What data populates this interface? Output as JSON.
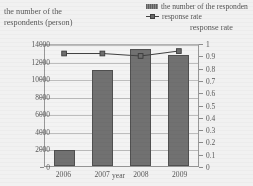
{
  "chart_data": {
    "type": "bar",
    "title": "",
    "categories": [
      "2006",
      "2007",
      "2008",
      "2009"
    ],
    "xlabel": "year",
    "ylabel": "the number of the respondents (person)",
    "y2label": "response rate",
    "ylim": [
      0,
      14000
    ],
    "y2lim": [
      0,
      1
    ],
    "yticks": [
      "0",
      "2000",
      "4000",
      "6000",
      "8000",
      "10000",
      "12000",
      "14000"
    ],
    "ytick_values": [
      0,
      2000,
      4000,
      6000,
      8000,
      10000,
      12000,
      14000
    ],
    "y2ticks": [
      "0",
      "0.1",
      "0.2",
      "0.3",
      "0.4",
      "0.5",
      "0.6",
      "0.7",
      "0.8",
      "0.9",
      "1"
    ],
    "y2tick_values": [
      0,
      0.1,
      0.2,
      0.3,
      0.4,
      0.5,
      0.6,
      0.7,
      0.8,
      0.9,
      1
    ],
    "grid": true,
    "legend_position": "top-right",
    "series": [
      {
        "name": "the number of the respondents",
        "legend_label": "the number of the responden",
        "type": "bar",
        "axis": "left",
        "color": "#707070",
        "values": [
          1800,
          10900,
          13300,
          12600
        ]
      },
      {
        "name": "response rate",
        "legend_label": "response rate",
        "type": "line",
        "axis": "right",
        "color": "#3d3d3d",
        "values": [
          0.93,
          0.93,
          0.91,
          0.95
        ]
      }
    ]
  },
  "axes": {
    "left_title": "the number of the\nrespondents (person)",
    "left_title_line1": "the number of the",
    "left_title_line2": "respondents (person)",
    "right_title": "response rate",
    "x_title": "year"
  }
}
